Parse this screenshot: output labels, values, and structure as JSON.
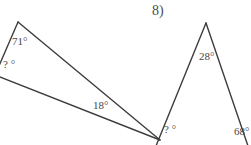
{
  "page": {
    "background_color": "#ffffff",
    "line_color": "#3d3d3d",
    "text_color": "#474747",
    "width": 251,
    "height": 145
  },
  "problems": [
    {
      "id": "problem-7",
      "number_label": ")",
      "shape": "triangle",
      "note": "narrow obtuse triangle, left portion cropped by image edge",
      "vertices": {
        "apex": [
          18,
          22
        ],
        "left": [
          -4,
          74
        ],
        "right": [
          160,
          140
        ]
      },
      "angles": [
        {
          "name": "top-angle",
          "value": "71°",
          "vertex": "apex"
        },
        {
          "name": "unknown-angle",
          "value": "? °",
          "vertex": "left"
        },
        {
          "name": "right-angle",
          "value": "18°",
          "vertex": "right"
        }
      ]
    },
    {
      "id": "problem-8",
      "number_label": "8)",
      "shape": "triangle",
      "note": "tall isosceles-like triangle, bottom and right cropped by image edge",
      "vertices": {
        "apex": [
          206,
          23
        ],
        "left": [
          157,
          145
        ],
        "right": [
          247,
          145
        ]
      },
      "angles": [
        {
          "name": "apex-angle",
          "value": "28°",
          "vertex": "apex"
        },
        {
          "name": "unknown-angle",
          "value": "? °",
          "vertex": "left"
        },
        {
          "name": "right-angle",
          "value": "68°",
          "vertex": "right"
        }
      ]
    }
  ]
}
